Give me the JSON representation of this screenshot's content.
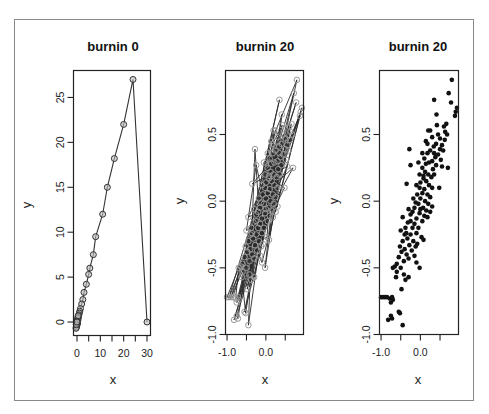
{
  "figure": {
    "panels": [
      {
        "title": "burnin 0",
        "xlabel": "x",
        "ylabel": "y"
      },
      {
        "title": "burnin 20",
        "xlabel": "x",
        "ylabel": "y"
      },
      {
        "title": "burnin 20",
        "xlabel": "x",
        "ylabel": "y"
      }
    ]
  },
  "chart_data": [
    {
      "type": "line",
      "title": "burnin 0",
      "xlabel": "x",
      "ylabel": "y",
      "xlim": [
        -1.5,
        31.5
      ],
      "ylim": [
        -1.5,
        28
      ],
      "xticks": [
        0,
        10,
        20,
        30
      ],
      "xminor_ticks": [
        5,
        15,
        25
      ],
      "yticks": [
        0,
        5,
        10,
        15,
        20,
        25
      ],
      "grid": false,
      "markers": "open circles connected by lines",
      "points": [
        [
          30,
          0
        ],
        [
          24,
          27
        ],
        [
          20,
          22
        ],
        [
          16,
          18.2
        ],
        [
          13,
          15
        ],
        [
          11,
          12
        ],
        [
          8,
          9.5
        ],
        [
          7,
          7.5
        ],
        [
          5.5,
          6
        ],
        [
          5,
          5.3
        ],
        [
          4,
          4.2
        ],
        [
          3,
          3.3
        ],
        [
          2.5,
          2.5
        ],
        [
          2,
          2
        ],
        [
          1.5,
          1.5
        ],
        [
          1.2,
          1.2
        ],
        [
          1,
          1
        ],
        [
          0.8,
          0.8
        ],
        [
          0.6,
          0.6
        ],
        [
          0.5,
          0.4
        ],
        [
          0.4,
          0.2
        ],
        [
          0.3,
          0
        ],
        [
          0.2,
          -0.1
        ],
        [
          0.1,
          -0.2
        ],
        [
          0,
          -0.3
        ],
        [
          -0.1,
          -0.4
        ],
        [
          -0.2,
          -0.5
        ],
        [
          -0.3,
          -0.6
        ],
        [
          -0.4,
          -0.7
        ],
        [
          0.2,
          0.3
        ],
        [
          0.4,
          0.5
        ],
        [
          -0.2,
          -0.2
        ],
        [
          0.1,
          0.1
        ],
        [
          -0.3,
          -0.3
        ],
        [
          0.5,
          0.7
        ],
        [
          0.0,
          0.0
        ]
      ]
    },
    {
      "type": "line",
      "title": "burnin 20",
      "xlabel": "x",
      "ylabel": "y",
      "xlim": [
        -1.04,
        0.97
      ],
      "ylim": [
        -1.0,
        0.98
      ],
      "xticks": [
        -1.0,
        0.0
      ],
      "xminor_ticks": [
        -0.5,
        0.5
      ],
      "yticks": [
        -1.0,
        -0.5,
        0.0,
        0.5
      ],
      "grid": false,
      "markers": "gray open circles connected by lines",
      "points_ref": "same samples as panel 3"
    },
    {
      "type": "scatter",
      "title": "burnin 20",
      "xlabel": "x",
      "ylabel": "y",
      "xlim": [
        -1.04,
        0.97
      ],
      "ylim": [
        -1.0,
        0.98
      ],
      "xticks": [
        -1.0,
        0.0
      ],
      "xminor_ticks": [
        -0.5,
        0.5
      ],
      "yticks": [
        -1.0,
        -0.5,
        0.0,
        0.5
      ],
      "grid": false,
      "markers": "filled black circles",
      "points": [
        [
          0.8,
          0.91
        ],
        [
          0.72,
          0.81
        ],
        [
          0.35,
          0.76
        ],
        [
          0.78,
          0.74
        ],
        [
          0.93,
          0.7
        ],
        [
          0.9,
          0.67
        ],
        [
          0.88,
          0.64
        ],
        [
          0.41,
          0.65
        ],
        [
          0.66,
          0.58
        ],
        [
          0.6,
          0.56
        ],
        [
          0.63,
          0.52
        ],
        [
          0.68,
          0.5
        ],
        [
          0.25,
          0.53
        ],
        [
          0.2,
          0.53
        ],
        [
          0.45,
          0.5
        ],
        [
          0.5,
          0.47
        ],
        [
          0.3,
          0.48
        ],
        [
          0.14,
          0.45
        ],
        [
          0.4,
          0.43
        ],
        [
          0.55,
          0.42
        ],
        [
          0.5,
          0.39
        ],
        [
          0.58,
          0.38
        ],
        [
          -0.28,
          0.39
        ],
        [
          0.34,
          0.41
        ],
        [
          0.25,
          0.38
        ],
        [
          0.18,
          0.36
        ],
        [
          0.45,
          0.35
        ],
        [
          0.38,
          0.33
        ],
        [
          0.52,
          0.31
        ],
        [
          0.3,
          0.3
        ],
        [
          0.22,
          0.29
        ],
        [
          0.1,
          0.32
        ],
        [
          0.14,
          0.28
        ],
        [
          -0.05,
          0.29
        ],
        [
          -0.25,
          0.27
        ],
        [
          0.4,
          0.27
        ],
        [
          0.55,
          0.26
        ],
        [
          0.7,
          0.25
        ],
        [
          0.32,
          0.24
        ],
        [
          0.05,
          0.25
        ],
        [
          0.12,
          0.22
        ],
        [
          0.2,
          0.2
        ],
        [
          0.28,
          0.18
        ],
        [
          -0.02,
          0.2
        ],
        [
          0.08,
          0.17
        ],
        [
          0.15,
          0.15
        ],
        [
          0.0,
          0.14
        ],
        [
          -0.1,
          0.12
        ],
        [
          0.22,
          0.12
        ],
        [
          0.3,
          0.1
        ],
        [
          0.48,
          0.1
        ],
        [
          0.1,
          0.09
        ],
        [
          0.05,
          0.06
        ],
        [
          -0.35,
          0.13
        ],
        [
          0.18,
          0.05
        ],
        [
          0.25,
          0.03
        ],
        [
          -0.08,
          0.05
        ],
        [
          0.0,
          0.02
        ],
        [
          0.12,
          0.0
        ],
        [
          0.2,
          -0.02
        ],
        [
          -0.05,
          -0.02
        ],
        [
          0.07,
          -0.05
        ],
        [
          0.15,
          -0.07
        ],
        [
          0.25,
          -0.08
        ],
        [
          -0.15,
          -0.05
        ],
        [
          -0.02,
          -0.09
        ],
        [
          0.1,
          -0.11
        ],
        [
          -0.2,
          -0.08
        ],
        [
          -0.1,
          -0.13
        ],
        [
          0.18,
          -0.12
        ],
        [
          -0.25,
          -0.1
        ],
        [
          0.05,
          -0.15
        ],
        [
          -0.3,
          -0.06
        ],
        [
          -0.45,
          -0.12
        ],
        [
          -0.15,
          -0.17
        ],
        [
          -0.32,
          -0.16
        ],
        [
          -0.2,
          -0.2
        ],
        [
          -0.05,
          -0.2
        ],
        [
          -0.38,
          -0.2
        ],
        [
          -0.1,
          -0.24
        ],
        [
          -0.25,
          -0.25
        ],
        [
          -0.4,
          -0.25
        ],
        [
          0.03,
          -0.27
        ],
        [
          0.08,
          -0.29
        ],
        [
          -0.33,
          -0.28
        ],
        [
          -0.18,
          -0.3
        ],
        [
          -0.45,
          -0.3
        ],
        [
          -0.28,
          -0.33
        ],
        [
          -0.52,
          -0.34
        ],
        [
          -0.12,
          -0.34
        ],
        [
          -0.4,
          -0.36
        ],
        [
          -0.22,
          -0.37
        ],
        [
          -0.48,
          -0.38
        ],
        [
          -0.35,
          -0.4
        ],
        [
          -0.15,
          -0.41
        ],
        [
          -0.55,
          -0.42
        ],
        [
          -0.3,
          -0.43
        ],
        [
          -0.42,
          -0.45
        ],
        [
          -0.1,
          -0.46
        ],
        [
          -0.6,
          -0.47
        ],
        [
          -0.65,
          -0.49
        ],
        [
          -0.5,
          -0.5
        ],
        [
          -0.02,
          -0.5
        ],
        [
          -0.7,
          -0.5
        ],
        [
          -0.6,
          -0.53
        ],
        [
          -0.42,
          -0.55
        ],
        [
          -0.3,
          -0.57
        ],
        [
          -0.38,
          -0.59
        ],
        [
          -0.62,
          -0.57
        ],
        [
          -0.48,
          -0.66
        ],
        [
          -1.0,
          -0.72
        ],
        [
          -0.95,
          -0.72
        ],
        [
          -0.9,
          -0.72
        ],
        [
          -0.85,
          -0.72
        ],
        [
          -0.78,
          -0.73
        ],
        [
          -0.72,
          -0.72
        ],
        [
          -0.75,
          -0.76
        ],
        [
          -0.7,
          -0.74
        ],
        [
          -0.55,
          -0.83
        ],
        [
          -0.52,
          -0.84
        ],
        [
          -0.75,
          -0.86
        ],
        [
          -0.72,
          -0.88
        ],
        [
          -0.82,
          -0.89
        ],
        [
          -0.45,
          -0.93
        ],
        [
          0.05,
          0.36
        ],
        [
          -0.02,
          0.1
        ],
        [
          0.35,
          0.2
        ],
        [
          -0.12,
          -0.01
        ],
        [
          0.3,
          -0.04
        ],
        [
          -0.36,
          -0.24
        ],
        [
          -0.25,
          -0.15
        ],
        [
          0.18,
          0.43
        ],
        [
          0.42,
          0.57
        ],
        [
          0.62,
          0.46
        ],
        [
          0.08,
          0.19
        ],
        [
          -0.18,
          0.02
        ],
        [
          -0.08,
          -0.32
        ],
        [
          -0.5,
          -0.22
        ],
        [
          0.35,
          0.36
        ],
        [
          0.0,
          -0.06
        ]
      ]
    }
  ]
}
